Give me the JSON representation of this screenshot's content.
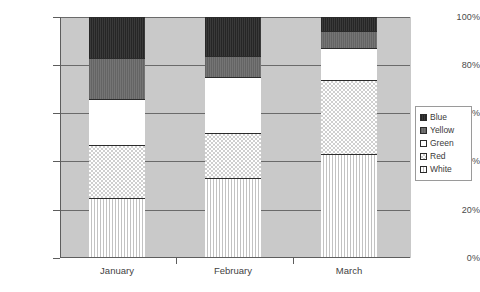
{
  "chart_data": {
    "type": "bar",
    "variant": "stacked-100-percent",
    "title": "",
    "xlabel": "",
    "ylabel": "",
    "categories": [
      "January",
      "February",
      "March"
    ],
    "ylim": [
      0,
      100
    ],
    "ytick_labels": [
      "0%",
      "20%",
      "40%",
      "60%",
      "80%",
      "100%"
    ],
    "ytick_values": [
      0,
      20,
      40,
      60,
      80,
      100
    ],
    "grid": true,
    "legend_position": "right",
    "stack_order_bottom_to_top": [
      "White",
      "Red",
      "Green",
      "Yellow",
      "Blue"
    ],
    "series": [
      {
        "name": "Blue",
        "values": [
          17,
          16,
          6
        ],
        "color": "#2e2e2e",
        "pattern": "solid-dark"
      },
      {
        "name": "Yellow",
        "values": [
          17,
          9,
          7
        ],
        "color": "#6b6b6b",
        "pattern": "solid-gray"
      },
      {
        "name": "Green",
        "values": [
          19,
          23,
          13
        ],
        "color": "#ffffff",
        "pattern": "solid-white"
      },
      {
        "name": "Red",
        "values": [
          22,
          19,
          31
        ],
        "color": "#e3e3e3",
        "pattern": "checkered"
      },
      {
        "name": "White",
        "values": [
          25,
          33,
          43
        ],
        "color": "#ffffff",
        "pattern": "vertical-lines"
      }
    ],
    "cumulative_tops": {
      "January": {
        "White": 25,
        "Red": 47,
        "Green": 66,
        "Yellow": 83,
        "Blue": 100
      },
      "February": {
        "White": 33,
        "Red": 52,
        "Green": 75,
        "Yellow": 84,
        "Blue": 100
      },
      "March": {
        "White": 43,
        "Red": 74,
        "Green": 87,
        "Yellow": 94,
        "Blue": 100
      }
    },
    "plot_background": "#c9c9c9"
  },
  "legend": {
    "items": [
      {
        "label": "Blue"
      },
      {
        "label": "Yellow"
      },
      {
        "label": "Green"
      },
      {
        "label": "Red"
      },
      {
        "label": "White"
      }
    ]
  },
  "axis": {
    "y": {
      "ticks": [
        {
          "label": "100%"
        },
        {
          "label": "80%"
        },
        {
          "label": "60%"
        },
        {
          "label": "40%"
        },
        {
          "label": "20%"
        },
        {
          "label": "0%"
        }
      ]
    },
    "x": {
      "ticks": [
        {
          "label": "January"
        },
        {
          "label": "February"
        },
        {
          "label": "March"
        }
      ]
    }
  }
}
